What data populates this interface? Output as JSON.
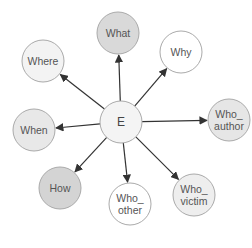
{
  "diagram": {
    "center": {
      "id": "E",
      "label": "E",
      "x": 121,
      "y": 122,
      "r": 21,
      "fill": "#f4f4f4"
    },
    "nodes": [
      {
        "id": "what",
        "lines": [
          "What"
        ],
        "x": 118,
        "y": 33,
        "r": 21,
        "fill": "#d9d9d9"
      },
      {
        "id": "where",
        "lines": [
          "Where"
        ],
        "x": 43,
        "y": 61,
        "r": 21,
        "fill": "#f3f3f3"
      },
      {
        "id": "why",
        "lines": [
          "Why"
        ],
        "x": 181,
        "y": 52,
        "r": 21,
        "fill": "#ffffff"
      },
      {
        "id": "when",
        "lines": [
          "When"
        ],
        "x": 34,
        "y": 130,
        "r": 21,
        "fill": "#e8e8e8"
      },
      {
        "id": "who_author",
        "lines": [
          "Who_",
          "author"
        ],
        "x": 229,
        "y": 120,
        "r": 21,
        "fill": "#e6e6e6"
      },
      {
        "id": "how",
        "lines": [
          "How"
        ],
        "x": 60,
        "y": 188,
        "r": 21,
        "fill": "#d4d4d4"
      },
      {
        "id": "who_other",
        "lines": [
          "Who_",
          "other"
        ],
        "x": 130,
        "y": 204,
        "r": 21,
        "fill": "#ffffff"
      },
      {
        "id": "who_victim",
        "lines": [
          "Who_",
          "victim"
        ],
        "x": 194,
        "y": 195,
        "r": 21,
        "fill": "#eeeeee"
      }
    ],
    "edge_color": "#333333",
    "node_stroke": "#aaaaaa"
  }
}
